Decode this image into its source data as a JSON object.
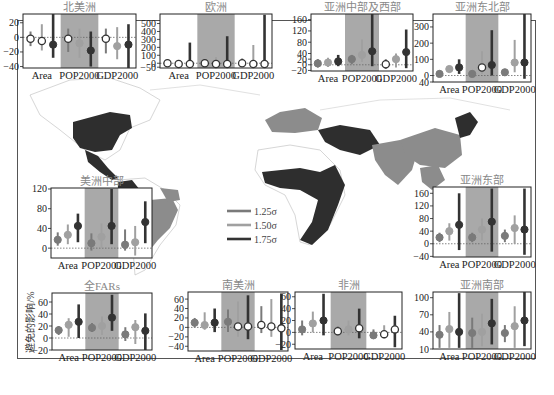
{
  "colors": {
    "level1": "#7a7a7a",
    "level2": "#a0a0a0",
    "level3": "#333333",
    "shade": "#a9a9a9",
    "map_dark": "#2e2e2e",
    "map_mid": "#8c8c8c",
    "map_light": "#b8b8b8",
    "zero_line": "#666666"
  },
  "legend": {
    "items": [
      {
        "label": "1.25σ",
        "color": "#7a7a7a"
      },
      {
        "label": "1.50σ",
        "color": "#a0a0a0"
      },
      {
        "label": "1.75σ",
        "color": "#333333"
      }
    ]
  },
  "y_axis_label": "避免的影响/%",
  "chart_data": {
    "type": "errorbar-panels",
    "categories": [
      "Area",
      "POP2000",
      "GDP2000"
    ],
    "series_names": [
      "1.25σ",
      "1.50σ",
      "1.75σ"
    ],
    "shaded_category": "POP2000",
    "panels": [
      {
        "id": "north-america",
        "title": "北美洲",
        "box": [
          23,
          14,
          113,
          54
        ],
        "ylim": [
          -42,
          32
        ],
        "yticks": [
          20,
          0,
          -20,
          -40
        ],
        "yticklabels": [
          "20",
          "0",
          "−20",
          "−40"
        ],
        "values": [
          [
            -2,
            -5,
            -10
          ],
          [
            -2,
            -8,
            -18
          ],
          [
            -2,
            -12,
            -10
          ]
        ],
        "low": [
          [
            -12,
            -18,
            -28
          ],
          [
            -20,
            -28,
            -40
          ],
          [
            -22,
            -30,
            -42
          ]
        ],
        "high": [
          [
            8,
            18,
            32
          ],
          [
            12,
            12,
            8
          ],
          [
            12,
            14,
            18
          ]
        ],
        "hollow": [
          [
            true,
            true,
            false
          ],
          [
            true,
            false,
            false
          ],
          [
            true,
            false,
            false
          ]
        ]
      },
      {
        "id": "europe",
        "title": "欧洲",
        "box": [
          160,
          14,
          112,
          54
        ],
        "ylim": [
          -60,
          620
        ],
        "yticks": [
          500,
          400,
          300,
          200,
          100,
          0,
          -50
        ],
        "yticklabels": [
          "500",
          "400",
          "300",
          "200",
          "100",
          "0",
          "−50"
        ],
        "values": [
          [
            0,
            -10,
            -10
          ],
          [
            0,
            -10,
            -10
          ],
          [
            0,
            -10,
            -10
          ]
        ],
        "low": [
          [
            -40,
            -50,
            -50
          ],
          [
            -40,
            -50,
            -50
          ],
          [
            -40,
            -50,
            -50
          ]
        ],
        "high": [
          [
            30,
            40,
            260
          ],
          [
            40,
            80,
            340
          ],
          [
            60,
            230,
            610
          ]
        ],
        "hollow": [
          [
            true,
            true,
            true
          ],
          [
            true,
            true,
            true
          ],
          [
            true,
            true,
            true
          ]
        ]
      },
      {
        "id": "central-west-asia",
        "title": "亚洲中部及西部",
        "box": [
          311,
          14,
          102,
          57
        ],
        "ylim": [
          -22,
          180
        ],
        "yticks": [
          160,
          120,
          80,
          40,
          20,
          0,
          -20
        ],
        "yticklabels": [
          "160",
          "120",
          "80",
          "40",
          "20",
          "0",
          "−20"
        ],
        "values": [
          [
            5,
            8,
            12
          ],
          [
            20,
            35,
            48
          ],
          [
            2,
            20,
            45
          ]
        ],
        "low": [
          [
            -10,
            -8,
            -5
          ],
          [
            2,
            10,
            -5
          ],
          [
            -15,
            -10,
            -12
          ]
        ],
        "high": [
          [
            20,
            25,
            35
          ],
          [
            35,
            90,
            180
          ],
          [
            20,
            40,
            125
          ]
        ],
        "hollow": [
          [
            false,
            false,
            false
          ],
          [
            false,
            false,
            false
          ],
          [
            true,
            false,
            false
          ]
        ]
      },
      {
        "id": "northeast-asia",
        "title": "亚洲东北部",
        "box": [
          433,
          14,
          98,
          68
        ],
        "ylim": [
          -40,
          380
        ],
        "yticks": [
          300,
          200,
          100,
          0,
          -40
        ],
        "yticklabels": [
          "300",
          "200",
          "100",
          "0",
          "40"
        ],
        "values": [
          [
            10,
            40,
            50
          ],
          [
            10,
            50,
            65
          ],
          [
            20,
            80,
            80
          ]
        ],
        "low": [
          [
            -10,
            20,
            10
          ],
          [
            -10,
            10,
            0
          ],
          [
            0,
            20,
            -20
          ]
        ],
        "high": [
          [
            30,
            60,
            100
          ],
          [
            20,
            150,
            280
          ],
          [
            40,
            220,
            380
          ]
        ],
        "hollow": [
          [
            false,
            false,
            false
          ],
          [
            false,
            true,
            false
          ],
          [
            false,
            false,
            false
          ]
        ]
      },
      {
        "id": "central-america",
        "title": "美洲中部",
        "box": [
          51,
          188,
          101,
          70
        ],
        "ylim": [
          -20,
          122
        ],
        "yticks": [
          120,
          80,
          40,
          0
        ],
        "yticklabels": [
          "120",
          "80",
          "40",
          "0"
        ],
        "values": [
          [
            17,
            27,
            45
          ],
          [
            10,
            23,
            45
          ],
          [
            7,
            12,
            53
          ]
        ],
        "low": [
          [
            5,
            8,
            12
          ],
          [
            -5,
            0,
            8
          ],
          [
            -5,
            -15,
            10
          ]
        ],
        "high": [
          [
            32,
            48,
            70
          ],
          [
            30,
            50,
            120
          ],
          [
            38,
            45,
            95
          ]
        ],
        "hollow": [
          [
            false,
            false,
            false
          ],
          [
            false,
            false,
            false
          ],
          [
            false,
            false,
            false
          ]
        ]
      },
      {
        "id": "east-asia",
        "title": "亚洲东部",
        "box": [
          433,
          187,
          98,
          70
        ],
        "ylim": [
          -42,
          180
        ],
        "yticks": [
          160,
          120,
          80,
          40,
          0,
          -40
        ],
        "yticklabels": [
          "160",
          "120",
          "80",
          "40",
          "0",
          "−40"
        ],
        "values": [
          [
            20,
            40,
            60
          ],
          [
            20,
            45,
            70
          ],
          [
            25,
            50,
            45
          ]
        ],
        "low": [
          [
            5,
            10,
            -20
          ],
          [
            5,
            10,
            -25
          ],
          [
            5,
            0,
            -35
          ]
        ],
        "high": [
          [
            35,
            65,
            160
          ],
          [
            35,
            80,
            175
          ],
          [
            45,
            90,
            175
          ]
        ],
        "hollow": [
          [
            false,
            false,
            false
          ],
          [
            false,
            false,
            false
          ],
          [
            false,
            false,
            false
          ]
        ]
      },
      {
        "id": "all-fars",
        "title": "全FARs",
        "box": [
          52,
          293,
          100,
          57
        ],
        "ylim": [
          -20,
          75
        ],
        "yticks": [
          60,
          40,
          20,
          0,
          -20
        ],
        "yticklabels": [
          "60",
          "40",
          "20",
          "0",
          "−20"
        ],
        "values": [
          [
            13,
            22,
            27
          ],
          [
            17,
            20,
            34
          ],
          [
            6,
            18,
            12
          ]
        ],
        "low": [
          [
            5,
            2,
            0
          ],
          [
            10,
            5,
            12
          ],
          [
            -5,
            -10,
            -20
          ]
        ],
        "high": [
          [
            20,
            33,
            56
          ],
          [
            25,
            36,
            72
          ],
          [
            18,
            30,
            41
          ]
        ],
        "hollow": [
          [
            false,
            false,
            false
          ],
          [
            false,
            false,
            false
          ],
          [
            false,
            false,
            false
          ]
        ]
      },
      {
        "id": "south-america",
        "title": "南美洲",
        "box": [
          188,
          292,
          100,
          59
        ],
        "ylim": [
          -50,
          75
        ],
        "yticks": [
          60,
          40,
          20,
          0,
          -20,
          -40
        ],
        "yticklabels": [
          "60",
          "40",
          "20",
          "0",
          "−20",
          "−40"
        ],
        "values": [
          [
            10,
            5,
            10
          ],
          [
            12,
            2,
            2
          ],
          [
            5,
            2,
            -2
          ]
        ],
        "low": [
          [
            0,
            -5,
            -10
          ],
          [
            -10,
            -20,
            -25
          ],
          [
            -12,
            -20,
            -48
          ]
        ],
        "high": [
          [
            20,
            32,
            40
          ],
          [
            38,
            55,
            68
          ],
          [
            45,
            60,
            72
          ]
        ],
        "hollow": [
          [
            false,
            false,
            false
          ],
          [
            false,
            true,
            true
          ],
          [
            true,
            true,
            true
          ]
        ]
      },
      {
        "id": "africa",
        "title": "非洲",
        "box": [
          295,
          292,
          107,
          57
        ],
        "ylim": [
          -28,
          68
        ],
        "yticks": [
          60,
          40,
          20,
          0,
          -20
        ],
        "yticklabels": [
          "60",
          "40",
          "20",
          "0",
          "−20"
        ],
        "values": [
          [
            5,
            15,
            20
          ],
          [
            2,
            5,
            7
          ],
          [
            -5,
            -3,
            5
          ]
        ],
        "low": [
          [
            -5,
            0,
            -5
          ],
          [
            -5,
            -5,
            -10
          ],
          [
            -10,
            -10,
            -25
          ]
        ],
        "high": [
          [
            20,
            35,
            65
          ],
          [
            10,
            20,
            40
          ],
          [
            5,
            12,
            28
          ]
        ],
        "hollow": [
          [
            false,
            false,
            false
          ],
          [
            true,
            false,
            true
          ],
          [
            false,
            true,
            true
          ]
        ]
      },
      {
        "id": "south-asia",
        "title": "亚洲南部",
        "box": [
          433,
          292,
          98,
          57
        ],
        "ylim": [
          10,
          110
        ],
        "yticks": [
          100,
          70,
          40,
          10
        ],
        "yticklabels": [
          "100",
          "70",
          "40",
          "10"
        ],
        "values": [
          [
            35,
            45,
            40
          ],
          [
            38,
            40,
            55
          ],
          [
            38,
            50,
            60
          ]
        ],
        "low": [
          [
            12,
            12,
            12
          ],
          [
            12,
            15,
            18
          ],
          [
            22,
            12,
            15
          ]
        ],
        "high": [
          [
            52,
            75,
            108
          ],
          [
            65,
            72,
            98
          ],
          [
            52,
            85,
            110
          ]
        ],
        "hollow": [
          [
            false,
            false,
            false
          ],
          [
            false,
            false,
            false
          ],
          [
            false,
            false,
            false
          ]
        ]
      }
    ]
  }
}
